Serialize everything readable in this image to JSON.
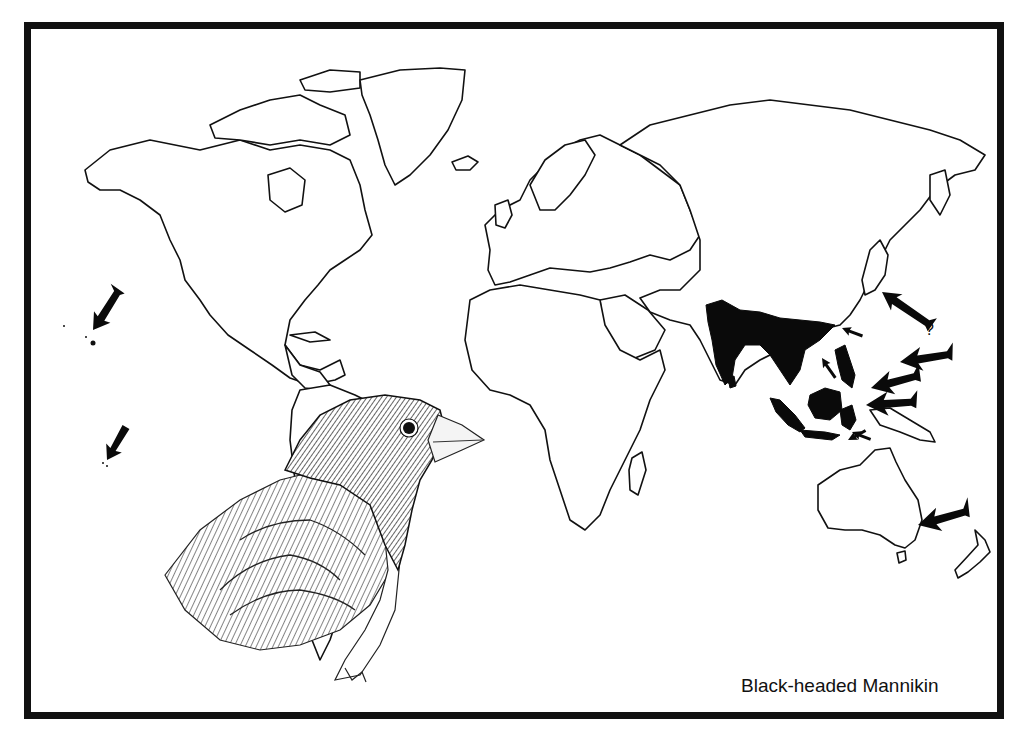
{
  "map": {
    "title": "Black-headed Mannikin",
    "type": "species range map",
    "range_color": "#0a0a0a",
    "outline_color": "#111111",
    "background": "#ffffff",
    "native_range_regions": [
      "India",
      "Sri Lanka",
      "Southeast Asia",
      "Southern China",
      "Philippines",
      "Borneo",
      "Sumatra",
      "Java",
      "Sulawesi"
    ],
    "introduced_arrows": [
      {
        "target": "Hawaii",
        "icon": "arrow-icon"
      },
      {
        "target": "Hawaii (southern islands)",
        "icon": "arrow-icon"
      },
      {
        "target": "Japan",
        "icon": "arrow-icon",
        "note": "?"
      },
      {
        "target": "Taiwan",
        "icon": "arrow-icon"
      },
      {
        "target": "Philippines",
        "icon": "arrow-icon"
      },
      {
        "target": "Palau / Micronesia",
        "icon": "arrow-icon"
      },
      {
        "target": "Moluccas",
        "icon": "arrow-icon"
      },
      {
        "target": "New Guinea",
        "icon": "arrow-icon"
      },
      {
        "target": "Lesser Sundas",
        "icon": "arrow-icon"
      },
      {
        "target": "Eastern Australia",
        "icon": "arrow-icon"
      }
    ],
    "uncertain_mark": "?",
    "illustration": "black-headed mannikin bird head and shoulders"
  }
}
